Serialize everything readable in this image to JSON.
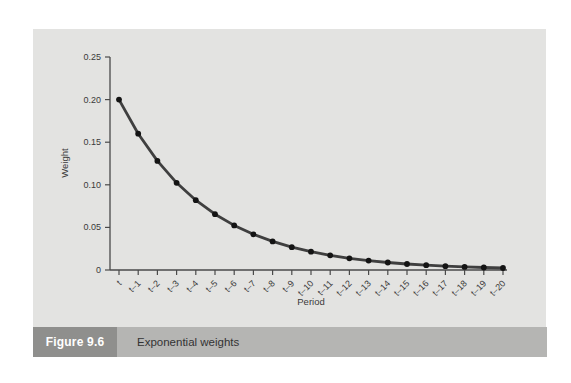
{
  "colors": {
    "page_bg": "#ffffff",
    "panel_bg": "#e3e3e1",
    "caption_bar_bg": "#b5b5b3",
    "figure_box_bg": "#8f8f8d",
    "figure_box_text": "#ffffff",
    "caption_text": "#333333",
    "axis_color": "#4a4a4a",
    "tick_text": "#3a3a3a"
  },
  "caption": {
    "figure_label": "Figure 9.6",
    "title": "Exponential weights"
  },
  "chart_data": {
    "type": "line",
    "title": "",
    "xlabel": "Period",
    "ylabel": "Weight",
    "categories": [
      "t",
      "t–1",
      "t–2",
      "t–3",
      "t–4",
      "t–5",
      "t–6",
      "t–7",
      "t–8",
      "t–9",
      "t–10",
      "t–11",
      "t–12",
      "t–13",
      "t–14",
      "t–15",
      "t–16",
      "t–17",
      "t–18",
      "t–19",
      "t–20"
    ],
    "values": [
      0.2,
      0.16,
      0.128,
      0.1024,
      0.0819,
      0.0655,
      0.0524,
      0.0419,
      0.0336,
      0.0268,
      0.0215,
      0.0172,
      0.0137,
      0.011,
      0.0088,
      0.007,
      0.0056,
      0.0045,
      0.0036,
      0.0029,
      0.0023
    ],
    "ylim": [
      0,
      0.25
    ],
    "ytick_values": [
      0,
      0.05,
      0.1,
      0.15,
      0.2,
      0.25
    ],
    "ytick_labels": [
      "0",
      "0.05",
      "0.10",
      "0.15",
      "0.20",
      "0.25"
    ],
    "xtick_rotation_deg": -45,
    "grid": false,
    "legend": "none",
    "line_color": "#3f3f3f",
    "marker": "circle",
    "marker_color": "#141414"
  }
}
